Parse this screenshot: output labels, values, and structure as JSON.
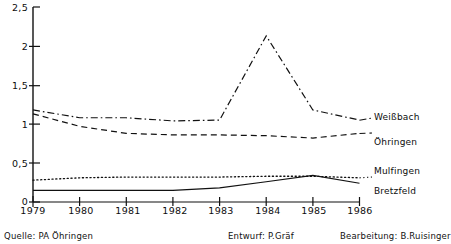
{
  "chart_data": {
    "type": "line",
    "title": "",
    "xlabel": "",
    "ylabel": "",
    "x": [
      1979,
      1980,
      1981,
      1982,
      1983,
      1984,
      1985,
      1986
    ],
    "xticklabels": [
      "1979",
      "1980",
      "1981",
      "1982",
      "1983",
      "1984",
      "1985",
      "1986"
    ],
    "yticks": [
      0,
      0.5,
      1,
      1.5,
      2,
      2.5
    ],
    "yticklabels": [
      "0",
      "0,5",
      "1",
      "1,5",
      "2",
      "2,5"
    ],
    "ylim": [
      0,
      2.5
    ],
    "xlim": [
      1979,
      1986
    ],
    "grid": false,
    "legend_position": "right-inline",
    "series": [
      {
        "name": "Weißbach",
        "style": "dash-dot",
        "values": [
          1.18,
          1.08,
          1.08,
          1.04,
          1.05,
          2.13,
          1.18,
          1.05
        ]
      },
      {
        "name": "Öhringen",
        "style": "dashed",
        "values": [
          1.13,
          0.97,
          0.88,
          0.86,
          0.86,
          0.85,
          0.82,
          0.88
        ]
      },
      {
        "name": "Mulfingen",
        "style": "dotted",
        "values": [
          0.28,
          0.31,
          0.32,
          0.32,
          0.32,
          0.33,
          0.33,
          0.31
        ]
      },
      {
        "name": "Bretzfeld",
        "style": "solid",
        "values": [
          0.15,
          0.15,
          0.15,
          0.15,
          0.18,
          0.26,
          0.34,
          0.24
        ]
      }
    ]
  },
  "axis": {
    "y_tick_labels": [
      "2,5",
      "2",
      "1,5",
      "1",
      "0,5",
      "0"
    ],
    "x_tick_labels": [
      "1979",
      "1980",
      "1981",
      "1982",
      "1983",
      "1984",
      "1985",
      "1986"
    ]
  },
  "series_labels": {
    "weissbach": "Weißbach",
    "oehringen": "Öhringen",
    "mulfingen": "Mulfingen",
    "bretzfeld": "Bretzfeld"
  },
  "footer": {
    "source": "Quelle: PA Öhringen",
    "design": "Entwurf: P.Gräf",
    "editing": "Bearbeitung: B.Ruisinger"
  },
  "colors": {
    "ink": "#111111",
    "background": "#ffffff"
  }
}
